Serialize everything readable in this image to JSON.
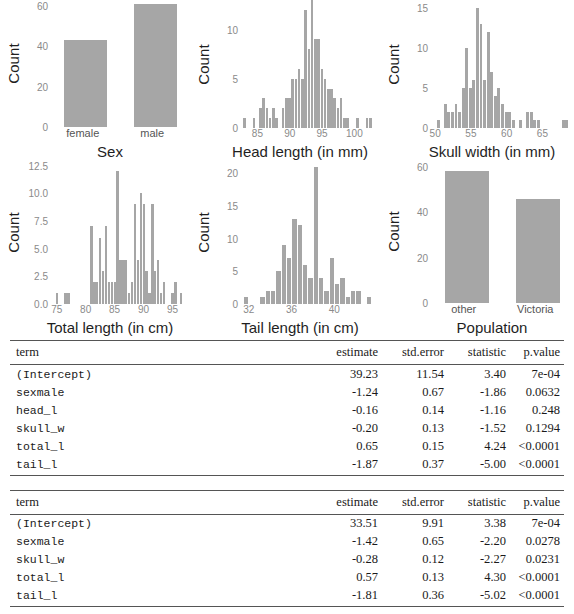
{
  "colors": {
    "bar_fill": "#a6a6a6",
    "axis_text": "#8a8a8a",
    "label_text": "#1f1f1f",
    "rule": "#555555"
  },
  "chart_data": [
    {
      "id": "sex",
      "type": "bar",
      "title": "",
      "xlabel": "Sex",
      "ylabel": "Count",
      "categories": [
        "female",
        "male"
      ],
      "values": [
        43,
        61
      ],
      "yticks": [
        0,
        20,
        40,
        60
      ],
      "ylim": [
        0,
        63
      ],
      "grid": false
    },
    {
      "id": "head-length",
      "type": "bar",
      "title": "",
      "xlabel": "Head length (in mm)",
      "ylabel": "Count",
      "xticks": [
        85,
        90,
        95,
        100
      ],
      "xlim": [
        82.0,
        103.5
      ],
      "yticks": [
        0,
        5,
        10
      ],
      "ylim": [
        0,
        13
      ],
      "grid": false,
      "x": [
        82.5,
        84.0,
        85.0,
        85.5,
        86.0,
        86.5,
        87.0,
        87.5,
        88.5,
        89.0,
        89.5,
        90.0,
        90.5,
        91.0,
        91.5,
        92.0,
        92.5,
        93.0,
        93.5,
        94.0,
        94.5,
        95.0,
        95.5,
        96.0,
        96.5,
        97.0,
        97.5,
        98.0,
        98.5,
        100.0,
        101.5,
        102.0
      ],
      "values": [
        1,
        1,
        2,
        3,
        2,
        1,
        2,
        1,
        2,
        3,
        3,
        5,
        5,
        6,
        5,
        12,
        8,
        13,
        9,
        9,
        6,
        5,
        4,
        4,
        3,
        2,
        3,
        1,
        1,
        1,
        1,
        1
      ]
    },
    {
      "id": "skull-width",
      "type": "bar",
      "title": "",
      "xlabel": "Skull width (in mm)",
      "ylabel": "Count",
      "xticks": [
        50,
        55,
        60,
        65
      ],
      "xlim": [
        49.0,
        69.0
      ],
      "yticks": [
        0,
        5,
        10,
        15
      ],
      "ylim": [
        0,
        16
      ],
      "grid": false,
      "x": [
        50.0,
        51.0,
        51.5,
        52.0,
        52.5,
        53.0,
        53.5,
        54.0,
        54.5,
        55.0,
        55.5,
        56.0,
        56.5,
        57.0,
        57.5,
        58.0,
        58.5,
        59.0,
        59.5,
        60.0,
        60.5,
        61.5,
        62.5,
        63.0,
        63.5,
        64.0,
        67.5,
        68.0
      ],
      "values": [
        1,
        3,
        2,
        2,
        3,
        2,
        5,
        10,
        5,
        6,
        15,
        13,
        6,
        12,
        7,
        4,
        5,
        3,
        2,
        2,
        1,
        1,
        2,
        2,
        1,
        1,
        1,
        1
      ]
    },
    {
      "id": "total-length",
      "type": "bar",
      "title": "",
      "xlabel": "Total length (in cm)",
      "ylabel": "Count",
      "xticks": [
        75,
        80,
        85,
        90,
        95
      ],
      "xlim": [
        73.5,
        97.5
      ],
      "yticks": [
        "0.0",
        "2.5",
        "5.0",
        "7.5",
        "10.0",
        "12.5"
      ],
      "ylim": [
        0,
        13
      ],
      "grid": false,
      "x": [
        74.5,
        76.0,
        76.5,
        80.5,
        81.0,
        81.5,
        82.0,
        82.5,
        83.0,
        83.5,
        84.0,
        84.5,
        85.0,
        85.5,
        86.0,
        86.5,
        87.0,
        87.5,
        88.0,
        88.5,
        89.0,
        89.5,
        90.0,
        90.5,
        91.0,
        91.5,
        92.0,
        92.5,
        93.0,
        94.5,
        95.0,
        96.0
      ],
      "values": [
        1,
        1,
        1,
        7,
        2,
        2,
        6,
        3,
        7,
        2,
        2,
        2,
        12,
        4,
        4,
        4,
        1,
        2,
        9,
        4,
        10,
        9,
        3,
        1,
        9,
        3,
        4,
        1,
        2,
        1,
        2,
        1
      ]
    },
    {
      "id": "tail-length",
      "type": "bar",
      "title": "",
      "xlabel": "Tail length (in cm)",
      "ylabel": "Count",
      "xticks": [
        32,
        36,
        40
      ],
      "xlim": [
        31.0,
        44.0
      ],
      "yticks": [
        0,
        5,
        10,
        15,
        20
      ],
      "ylim": [
        0,
        22
      ],
      "grid": false,
      "x": [
        31.5,
        33.0,
        33.5,
        34.0,
        34.5,
        35.0,
        35.5,
        36.0,
        36.5,
        37.0,
        37.5,
        38.0,
        38.5,
        39.0,
        39.5,
        40.0,
        40.5,
        41.0,
        41.5,
        42.0,
        43.0
      ],
      "values": [
        1,
        1,
        2,
        2,
        5,
        9,
        7,
        13,
        12,
        6,
        4,
        21,
        4,
        2,
        7,
        3,
        4,
        1,
        2,
        2,
        1
      ]
    },
    {
      "id": "population",
      "type": "bar",
      "title": "",
      "xlabel": "Population",
      "ylabel": "Count",
      "categories": [
        "other",
        "Victoria"
      ],
      "values": [
        58,
        46
      ],
      "yticks": [
        0,
        20,
        40,
        60
      ],
      "ylim": [
        0,
        63
      ],
      "grid": false
    }
  ],
  "tables": [
    {
      "id": "model-1",
      "headers": [
        "term",
        "estimate",
        "std.error",
        "statistic",
        "p.value"
      ],
      "rows": [
        [
          "(Intercept)",
          "39.23",
          "11.54",
          "3.40",
          "7e-04"
        ],
        [
          "sexmale",
          "-1.24",
          "0.67",
          "-1.86",
          "0.0632"
        ],
        [
          "head_l",
          "-0.16",
          "0.14",
          "-1.16",
          "0.248"
        ],
        [
          "skull_w",
          "-0.20",
          "0.13",
          "-1.52",
          "0.1294"
        ],
        [
          "total_l",
          "0.65",
          "0.15",
          "4.24",
          "<0.0001"
        ],
        [
          "tail_l",
          "-1.87",
          "0.37",
          "-5.00",
          "<0.0001"
        ]
      ]
    },
    {
      "id": "model-2",
      "headers": [
        "term",
        "estimate",
        "std.error",
        "statistic",
        "p.value"
      ],
      "rows": [
        [
          "(Intercept)",
          "33.51",
          "9.91",
          "3.38",
          "7e-04"
        ],
        [
          "sexmale",
          "-1.42",
          "0.65",
          "-2.20",
          "0.0278"
        ],
        [
          "skull_w",
          "-0.28",
          "0.12",
          "-2.27",
          "0.0231"
        ],
        [
          "total_l",
          "0.57",
          "0.13",
          "4.30",
          "<0.0001"
        ],
        [
          "tail_l",
          "-1.81",
          "0.36",
          "-5.02",
          "<0.0001"
        ]
      ]
    }
  ]
}
